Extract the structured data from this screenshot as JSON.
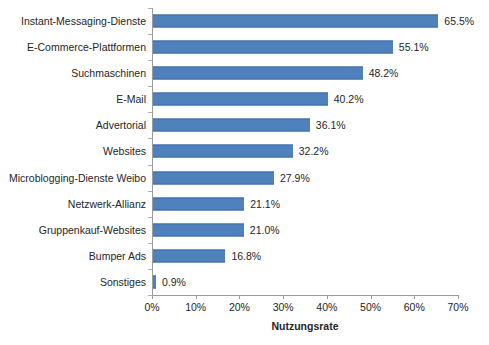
{
  "chart_data": {
    "type": "bar",
    "orientation": "horizontal",
    "title": "",
    "subtitle": "",
    "xlabel": "Nutzungsrate",
    "ylabel": "",
    "xlim": [
      0,
      70
    ],
    "x_tick_labels": [
      "0%",
      "10%",
      "20%",
      "30%",
      "40%",
      "50%",
      "60%",
      "70%"
    ],
    "x_ticks": [
      0,
      10,
      20,
      30,
      40,
      50,
      60,
      70
    ],
    "grid": false,
    "legend": false,
    "legend_position": "none",
    "bar_color": "#4F81BD",
    "categories": [
      "Instant-Messaging-Dienste",
      "E-Commerce-Plattformen",
      "Suchmaschinen",
      "E-Mail",
      "Advertorial",
      "Websites",
      "Microblogging-Dienste Weibo",
      "Netzwerk-Allianz",
      "Gruppenkauf-Websites",
      "Bumper Ads",
      "Sonstiges"
    ],
    "values": [
      65.5,
      55.1,
      48.2,
      40.2,
      36.1,
      32.2,
      27.9,
      21.1,
      21.0,
      16.8,
      0.9
    ],
    "data_labels": [
      "65.5%",
      "55.1%",
      "48.2%",
      "40.2%",
      "36.1%",
      "32.2%",
      "27.9%",
      "21.1%",
      "21.0%",
      "16.8%",
      "0.9%"
    ]
  },
  "colors": {
    "bar": "#4F81BD",
    "bar_edge": "#3F6DA3",
    "axis": "#9B9B9B",
    "text": "#262626",
    "background": "#FFFFFF"
  }
}
